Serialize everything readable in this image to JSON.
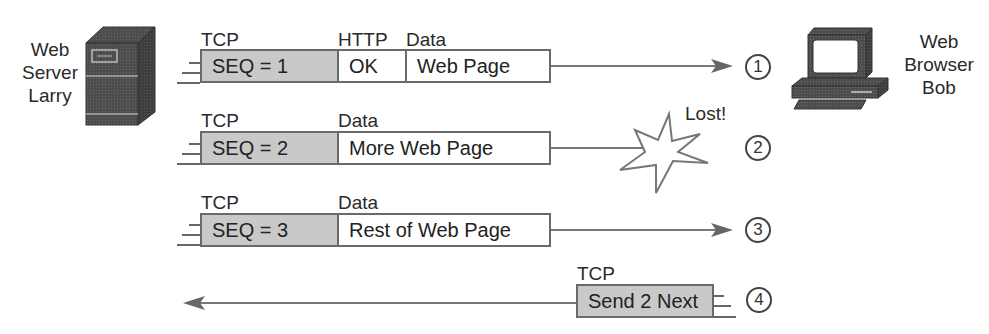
{
  "hosts": {
    "server": {
      "label_lines": [
        "Web",
        "Server",
        "Larry"
      ],
      "icon": "server-tower-icon"
    },
    "client": {
      "label_lines": [
        "Web",
        "Browser",
        "Bob"
      ],
      "icon": "desktop-pc-icon"
    }
  },
  "segments": [
    {
      "step": "1",
      "direction": "server-to-client",
      "headers": [
        "TCP",
        "HTTP",
        "Data"
      ],
      "fields": [
        "SEQ = 1",
        "OK",
        "Web Page"
      ],
      "outcome": "delivered"
    },
    {
      "step": "2",
      "direction": "server-to-client",
      "headers": [
        "TCP",
        "Data"
      ],
      "fields": [
        "SEQ = 2",
        "More Web Page"
      ],
      "outcome": "lost",
      "lost_label": "Lost!"
    },
    {
      "step": "3",
      "direction": "server-to-client",
      "headers": [
        "TCP",
        "Data"
      ],
      "fields": [
        "SEQ = 3",
        "Rest of Web Page"
      ],
      "outcome": "delivered"
    },
    {
      "step": "4",
      "direction": "client-to-server",
      "headers": [
        "TCP"
      ],
      "fields": [
        "Send 2 Next"
      ],
      "outcome": "delivered"
    }
  ],
  "colors": {
    "header_fill": "#c9c9c9",
    "data_fill": "#ffffff",
    "line": "#6a6a6a",
    "icon_dark": "#4a4a4a"
  }
}
